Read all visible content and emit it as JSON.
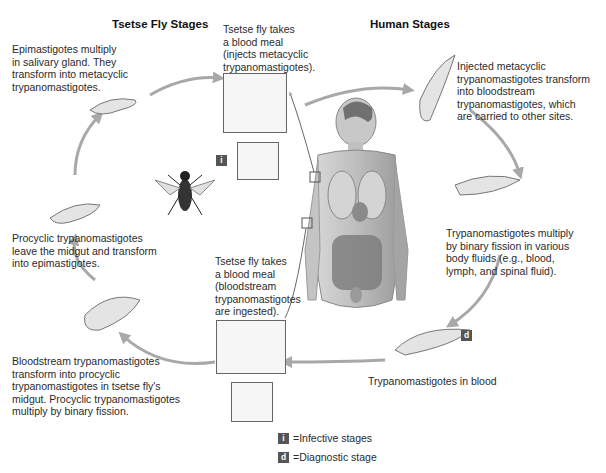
{
  "headings": {
    "tsetse": "Tsetse Fly Stages",
    "human": "Human Stages"
  },
  "steps": [
    {
      "id": "fly-bite-inject",
      "text": "Tsetse fly takes\na blood meal\n(injects metacyclic\ntrypanomastigotes)."
    },
    {
      "id": "metacyclic-transform",
      "text": "Injected metacyclic\ntrypanomastigotes transform\ninto bloodstream\ntrypanomastigotes, which\nare carried to other sites."
    },
    {
      "id": "binary-fission-human",
      "text": "Trypanomastigotes multiply\nby binary fission in various\nbody fluids (e.g., blood,\nlymph, and spinal fluid)."
    },
    {
      "id": "blood",
      "text": "Trypanomastigotes in blood"
    },
    {
      "id": "fly-bite-ingest",
      "text": "Tsetse fly takes\na blood meal\n(bloodstream\ntrypanomastigotes\nare ingested)."
    },
    {
      "id": "procyclic-transform",
      "text": "Bloodstream trypanomastigotes\ntransform into procyclic\ntrypanomastigotes in tsetse fly's\nmidgut. Procyclic trypanomastigotes\nmultiply by binary fission."
    },
    {
      "id": "epimastigote-transform",
      "text": "Procyclic trypanomastigotes\nleave the midgut and transform\ninto epimastigotes."
    },
    {
      "id": "salivary-gland",
      "text": "Epimastigotes multiply\nin salivary gland. They\ntransform into metacyclic\ntrypanomastigotes."
    }
  ],
  "badges": {
    "infective": "i",
    "diagnostic": "d"
  },
  "legend": [
    {
      "badge": "i",
      "text": "=Infective stages"
    },
    {
      "badge": "d",
      "text": "=Diagnostic stage"
    }
  ],
  "colors": {
    "arrow": "#a8a8a8",
    "badge": "#555555",
    "text": "#2a2a2a"
  }
}
